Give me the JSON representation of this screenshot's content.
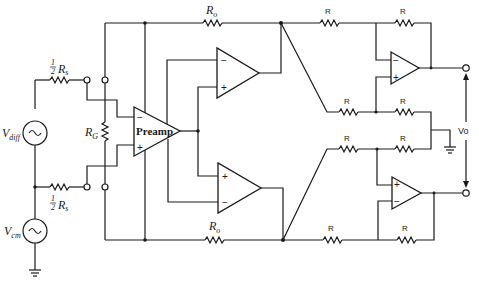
{
  "diagram": {
    "type": "circuit-schematic",
    "labels": {
      "source_resistor_top": {
        "frac": "1/2",
        "frac_num": "1",
        "frac_den": "2",
        "name": "R",
        "sub": "s"
      },
      "source_resistor_bottom": {
        "frac": "1/2",
        "frac_num": "1",
        "frac_den": "2",
        "name": "R",
        "sub": "s"
      },
      "vdiff": {
        "name": "V",
        "sub": "diff"
      },
      "vcm": {
        "name": "V",
        "sub": "cm"
      },
      "rg": {
        "name": "R",
        "sub": "G"
      },
      "ro_top": {
        "name": "R",
        "sub": "o"
      },
      "ro_bottom": {
        "name": "R",
        "sub": "o"
      },
      "preamp": "Preamp",
      "r_top_left": "R",
      "r_top_right": "R",
      "r_mid_upper_left": "R",
      "r_mid_upper_right": "R",
      "r_mid_lower_left": "R",
      "r_mid_lower_right": "R",
      "r_bottom_left": "R",
      "r_bottom_right": "R",
      "vo": "Vo",
      "minus": "−",
      "plus": "+"
    },
    "components": [
      {
        "id": "vdiff",
        "kind": "ac-source"
      },
      {
        "id": "vcm",
        "kind": "ac-source"
      },
      {
        "id": "rs_top",
        "kind": "resistor",
        "value": "1/2 Rs"
      },
      {
        "id": "rs_bottom",
        "kind": "resistor",
        "value": "1/2 Rs"
      },
      {
        "id": "rg",
        "kind": "resistor",
        "value": "RG"
      },
      {
        "id": "ro_top",
        "kind": "resistor",
        "value": "Ro"
      },
      {
        "id": "ro_bottom",
        "kind": "resistor",
        "value": "Ro"
      },
      {
        "id": "preamp",
        "kind": "op-amp",
        "label": "Preamp"
      },
      {
        "id": "buffer_upper",
        "kind": "op-amp"
      },
      {
        "id": "buffer_lower",
        "kind": "op-amp"
      },
      {
        "id": "out_amp_upper",
        "kind": "op-amp"
      },
      {
        "id": "out_amp_lower",
        "kind": "op-amp"
      },
      {
        "id": "r_x8",
        "kind": "resistor",
        "value": "R",
        "count": 8
      },
      {
        "id": "ground_input",
        "kind": "ground"
      },
      {
        "id": "ground_output",
        "kind": "ground"
      }
    ]
  }
}
